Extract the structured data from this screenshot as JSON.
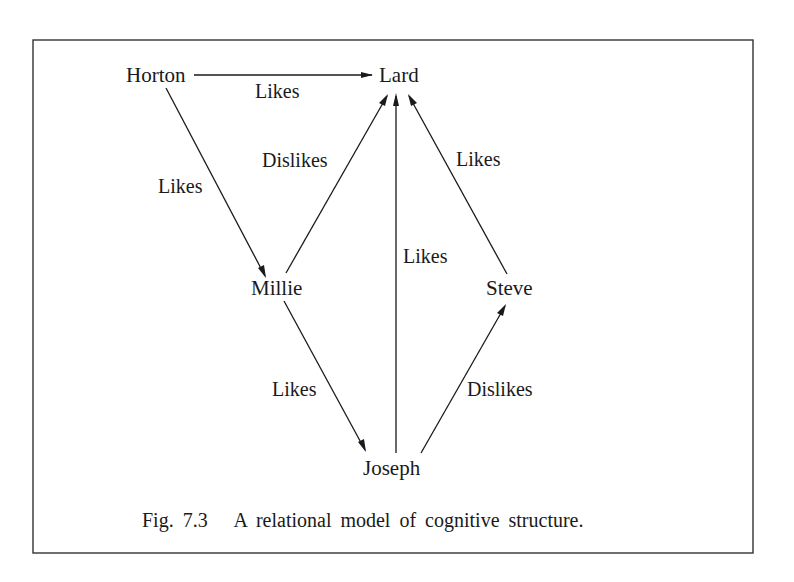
{
  "figure": {
    "caption": "Fig. 7.3   A relational model of cognitive structure.",
    "nodes": [
      {
        "id": "horton",
        "label": "Horton"
      },
      {
        "id": "lard",
        "label": "Lard"
      },
      {
        "id": "millie",
        "label": "Millie"
      },
      {
        "id": "steve",
        "label": "Steve"
      },
      {
        "id": "joseph",
        "label": "Joseph"
      }
    ],
    "edges": [
      {
        "from": "horton",
        "to": "lard",
        "label": "Likes"
      },
      {
        "from": "horton",
        "to": "millie",
        "label": "Likes"
      },
      {
        "from": "millie",
        "to": "lard",
        "label": "Dislikes"
      },
      {
        "from": "joseph",
        "to": "lard",
        "label": "Likes"
      },
      {
        "from": "steve",
        "to": "lard",
        "label": "Likes"
      },
      {
        "from": "millie",
        "to": "joseph",
        "label": "Likes"
      },
      {
        "from": "joseph",
        "to": "steve",
        "label": "Dislikes"
      }
    ]
  }
}
